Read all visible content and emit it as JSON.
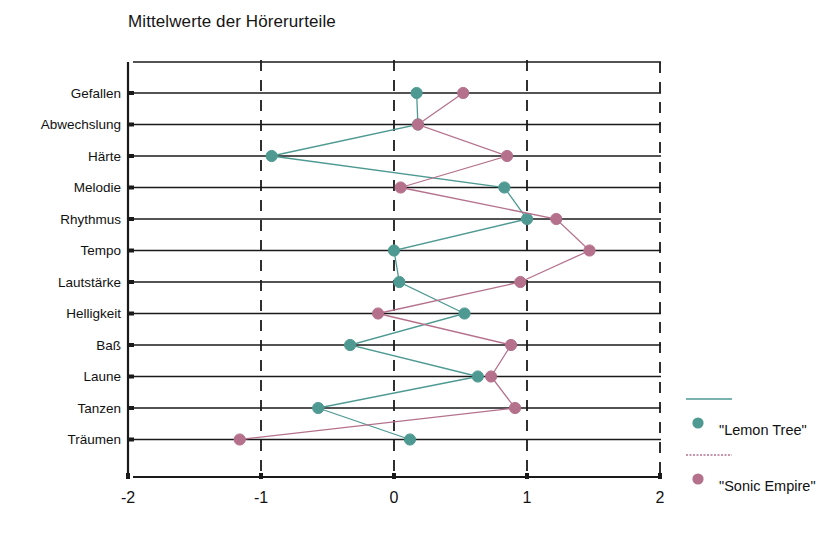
{
  "chart_data": {
    "type": "line",
    "title": "Mittelwerte der Hörerurteile",
    "orientation": "horizontal",
    "xlabel": "",
    "ylabel": "",
    "xlim": [
      -2,
      2
    ],
    "xticks": [
      -2,
      -1,
      0,
      1,
      2
    ],
    "xtick_labels": [
      "-2",
      "-1",
      "0",
      "1",
      "2"
    ],
    "grid": "horizontal-solid-rows-plus-vertical-dashed",
    "legend_position": "right",
    "categories": [
      "Gefallen",
      "Abwechslung",
      "Härte",
      "Melodie",
      "Rhythmus",
      "Tempo",
      "Lautstärke",
      "Helligkeit",
      "Baß",
      "Laune",
      "Tanzen",
      "Träumen"
    ],
    "series": [
      {
        "name": "\"Lemon Tree\"",
        "color": "#4e9a92",
        "values": [
          0.17,
          0.18,
          -0.92,
          0.83,
          1.0,
          0.0,
          0.04,
          0.53,
          -0.33,
          0.63,
          -0.57,
          0.12
        ]
      },
      {
        "name": "\"Sonic Empire\"",
        "color": "#b5718c",
        "values": [
          0.52,
          0.18,
          0.85,
          0.05,
          1.22,
          1.47,
          0.95,
          -0.12,
          0.88,
          0.73,
          0.91,
          -1.16
        ]
      }
    ]
  },
  "legend": {
    "entries": [
      {
        "label": "\"Lemon Tree\"",
        "color": "#4e9a92"
      },
      {
        "label": "\"Sonic Empire\"",
        "color": "#b5718c"
      }
    ]
  },
  "axis": {
    "tick_labels": [
      "-2",
      "-1",
      "0",
      "1",
      "2"
    ],
    "category_labels": [
      "Gefallen",
      "Abwechslung",
      "Härte",
      "Melodie",
      "Rhythmus",
      "Tempo",
      "Lautstärke",
      "Helligkeit",
      "Baß",
      "Laune",
      "Tanzen",
      "Träumen"
    ]
  },
  "colors": {
    "series_lemon_tree": "#4e9a92",
    "series_sonic_empire": "#b5718c",
    "axis": "#1a1a1a",
    "background": "#ffffff"
  }
}
